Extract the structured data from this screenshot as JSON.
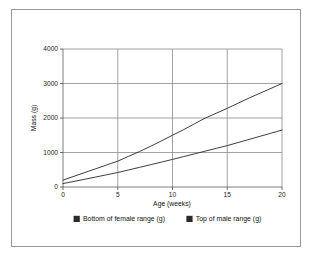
{
  "chart_data": {
    "type": "line",
    "title": "",
    "subtitle": "",
    "xlabel": "Age (weeks)",
    "ylabel": "Mass (g)",
    "xlim": [
      0,
      20
    ],
    "ylim": [
      0,
      4000
    ],
    "xticks": [
      0,
      5,
      10,
      15,
      20
    ],
    "yticks": [
      0,
      1000,
      2000,
      3000,
      4000
    ],
    "xtick_labels": [
      "0",
      "5",
      "10",
      "15",
      "20"
    ],
    "ytick_labels": [
      "0",
      "1000",
      "2000",
      "3000",
      "4000"
    ],
    "grid": true,
    "grid_color": "#8c8c8c",
    "legend_position": "bottom",
    "x": [
      0,
      1,
      2,
      3,
      4,
      5,
      6,
      7,
      8,
      9,
      10,
      11,
      12,
      13,
      14,
      15,
      16,
      17,
      18,
      19,
      20
    ],
    "series": [
      {
        "name": "Bottom of female range (g)",
        "color": "#333333",
        "marker_color": "#2b2b2b",
        "values": [
          200,
          310,
          420,
          530,
          640,
          750,
          890,
          1030,
          1180,
          1340,
          1500,
          1660,
          1830,
          2000,
          2140,
          2280,
          2430,
          2580,
          2720,
          2860,
          3000
        ]
      },
      {
        "name": "Top of male range (g)",
        "color": "#333333",
        "marker_color": "#2b2b2b",
        "values": [
          100,
          162,
          225,
          290,
          355,
          420,
          495,
          570,
          645,
          722,
          800,
          880,
          960,
          1040,
          1120,
          1200,
          1290,
          1380,
          1470,
          1560,
          1650
        ]
      }
    ]
  },
  "legend": {
    "items": [
      {
        "label": "Bottom of female range (g)",
        "swatch": "legend-swatch-icon"
      },
      {
        "label": "Top of male range (g)",
        "swatch": "legend-swatch-icon"
      }
    ]
  },
  "axes": {
    "y_title": "Mass (g)",
    "x_title": "Age (weeks)"
  }
}
